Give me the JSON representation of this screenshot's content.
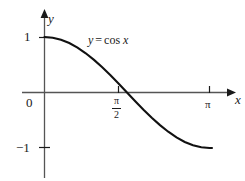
{
  "figure": {
    "background_color": "#ffffff",
    "ink_color": "#1a1a1a",
    "axis_color": "#555555"
  },
  "labels": {
    "y_axis": "y",
    "x_axis": "x",
    "y_tick_one": "1",
    "origin": "0",
    "y_tick_neg_one": "−1",
    "x_tick_pi": "π",
    "x_tick_pi_over_two_numerator": "π",
    "x_tick_pi_over_two_denominator": "2",
    "equation_lhs": "y",
    "equation_relation": "=",
    "equation_rhs_function": "cos",
    "equation_rhs_variable": "x"
  },
  "chart_data": {
    "type": "line",
    "xlabel": "x",
    "ylabel": "y",
    "xlim": [
      0,
      3.6652
    ],
    "ylim": [
      -1.35,
      1.35
    ],
    "grid": false,
    "legend": null,
    "annotations": [
      {
        "text": "y = cos x",
        "x": 1.15,
        "y": 0.82
      }
    ],
    "x_ticks": [
      {
        "value": 1.5708,
        "label": "π/2"
      },
      {
        "value": 3.1416,
        "label": "π"
      }
    ],
    "y_ticks": [
      {
        "value": 1,
        "label": "1"
      },
      {
        "value": 0,
        "label": "0"
      },
      {
        "value": -1,
        "label": "−1"
      }
    ],
    "series": [
      {
        "name": "y = cos x",
        "function": "cos(x)",
        "x": [
          0,
          0.1571,
          0.3142,
          0.4712,
          0.6283,
          0.7854,
          0.9425,
          1.0996,
          1.2566,
          1.4137,
          1.5708,
          1.7279,
          1.885,
          2.042,
          2.1991,
          2.3562,
          2.5133,
          2.6704,
          2.8274,
          2.9845,
          3.1416
        ],
        "y": [
          1.0,
          0.9877,
          0.9511,
          0.891,
          0.809,
          0.7071,
          0.5878,
          0.454,
          0.309,
          0.1564,
          0.0,
          -0.1564,
          -0.309,
          -0.454,
          -0.5878,
          -0.7071,
          -0.809,
          -0.891,
          -0.9511,
          -0.9877,
          -1.0
        ]
      }
    ]
  }
}
